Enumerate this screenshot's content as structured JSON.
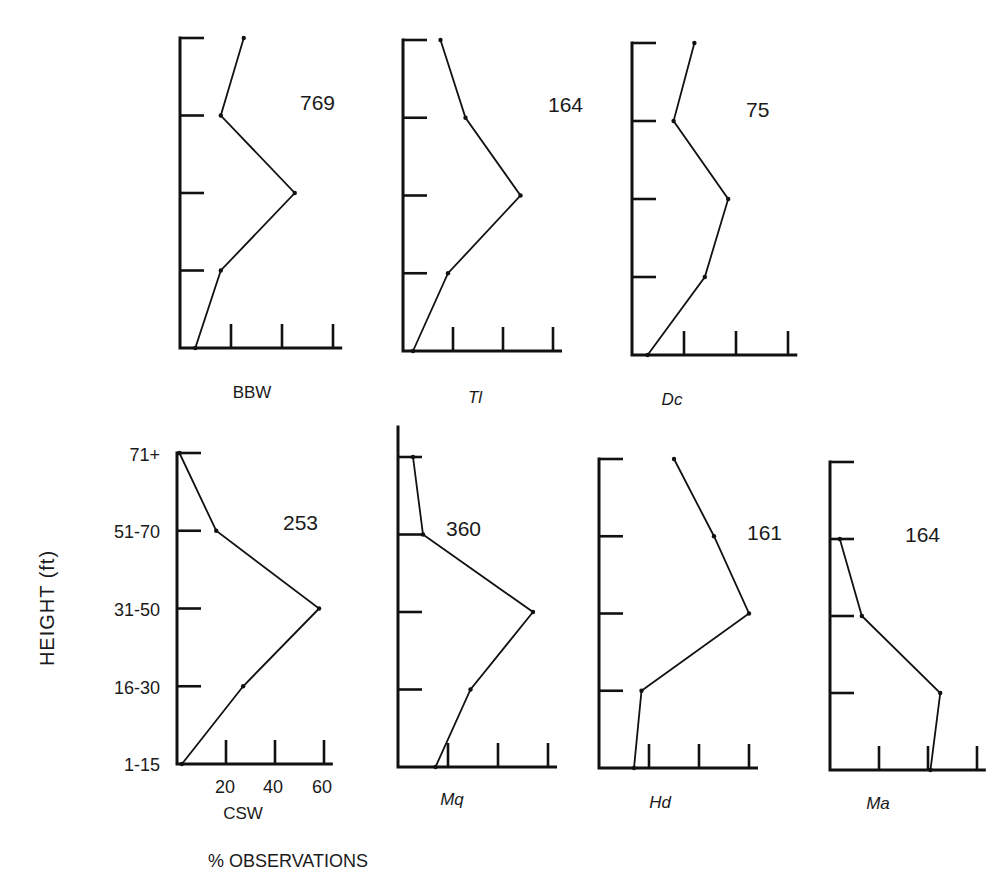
{
  "figure": {
    "y_axis_title": "HEIGHT (ft)",
    "x_axis_title": "% OBSERVATIONS",
    "height_classes": [
      "71+",
      "51-70",
      "31-50",
      "16-30",
      "1-15"
    ],
    "x_tick_labels": [
      "20",
      "40",
      "60"
    ]
  },
  "chart_data": {
    "type": "line",
    "title": "",
    "xlabel": "% OBSERVATIONS",
    "ylabel": "HEIGHT (ft)",
    "categories": [
      "1-15",
      "16-30",
      "31-50",
      "51-70",
      "71+"
    ],
    "xlim": [
      0,
      70
    ],
    "x_ticks": [
      20,
      40,
      60
    ],
    "grid": false,
    "legend": "none (each panel labeled by species code beneath, sample size at upper right)",
    "panels": [
      {
        "name": "BBW",
        "italic": false,
        "n": 769,
        "values": {
          "1-15": 6,
          "16-30": 16,
          "31-50": 45,
          "51-70": 16,
          "71+": 25
        }
      },
      {
        "name": "Tl",
        "italic": true,
        "n": 164,
        "values": {
          "1-15": 4,
          "16-30": 18,
          "31-50": 47,
          "51-70": 25,
          "71+": 15
        }
      },
      {
        "name": "Dc",
        "italic": true,
        "n": 75,
        "values": {
          "1-15": 6,
          "16-30": 28,
          "31-50": 37,
          "51-70": 16,
          "71+": 24
        }
      },
      {
        "name": "CSW",
        "italic": false,
        "n": 253,
        "values": {
          "1-15": 2,
          "16-30": 27,
          "31-50": 58,
          "51-70": 16,
          "71+": 1
        }
      },
      {
        "name": "Mq",
        "italic": true,
        "n": 360,
        "values": {
          "1-15": 15,
          "16-30": 29,
          "31-50": 54,
          "51-70": 10,
          "71+": 6
        }
      },
      {
        "name": "Hd",
        "italic": true,
        "n": 161,
        "values": {
          "1-15": 14,
          "16-30": 17,
          "31-50": 60,
          "51-70": 46,
          "71+": 30
        }
      },
      {
        "name": "Ma",
        "italic": true,
        "n": 164,
        "values": {
          "1-15": 41,
          "16-30": 45,
          "31-50": 13,
          "51-70": 4,
          "71+": null
        }
      }
    ]
  },
  "layout_panels": [
    {
      "x0": 180,
      "ytop": 38,
      "ybottom": 348,
      "xscale": 2.55,
      "count_x": 300,
      "count_y": 110,
      "label_x": 252,
      "label_y": 398,
      "top_tick": true,
      "extra_top": 0
    },
    {
      "x0": 403,
      "ytop": 40,
      "ybottom": 351,
      "xscale": 2.5,
      "count_x": 548,
      "count_y": 112,
      "label_x": 475,
      "label_y": 403,
      "top_tick": true,
      "extra_top": 0
    },
    {
      "x0": 632,
      "ytop": 43,
      "ybottom": 355,
      "xscale": 2.6,
      "count_x": 746,
      "count_y": 117,
      "label_x": 672,
      "label_y": 405,
      "top_tick": true,
      "extra_top": 0
    },
    {
      "x0": 177,
      "ytop": 453,
      "ybottom": 764,
      "xscale": 2.45,
      "count_x": 283,
      "count_y": 530,
      "label_x": 243,
      "label_y": 819,
      "top_tick": true,
      "extra_top": 0
    },
    {
      "x0": 398,
      "ytop": 457,
      "ybottom": 767,
      "xscale": 2.5,
      "count_x": 446,
      "count_y": 536,
      "label_x": 452,
      "label_y": 805,
      "top_tick": true,
      "extra_top": 30
    },
    {
      "x0": 599,
      "ytop": 459,
      "ybottom": 768,
      "xscale": 2.5,
      "count_x": 747,
      "count_y": 540,
      "label_x": 660,
      "label_y": 808,
      "top_tick": true,
      "extra_top": 0
    },
    {
      "x0": 830,
      "ytop": 462,
      "ybottom": 770,
      "xscale": 2.45,
      "count_x": 905,
      "count_y": 542,
      "label_x": 878,
      "label_y": 809,
      "top_tick": true,
      "extra_top": 0
    }
  ]
}
